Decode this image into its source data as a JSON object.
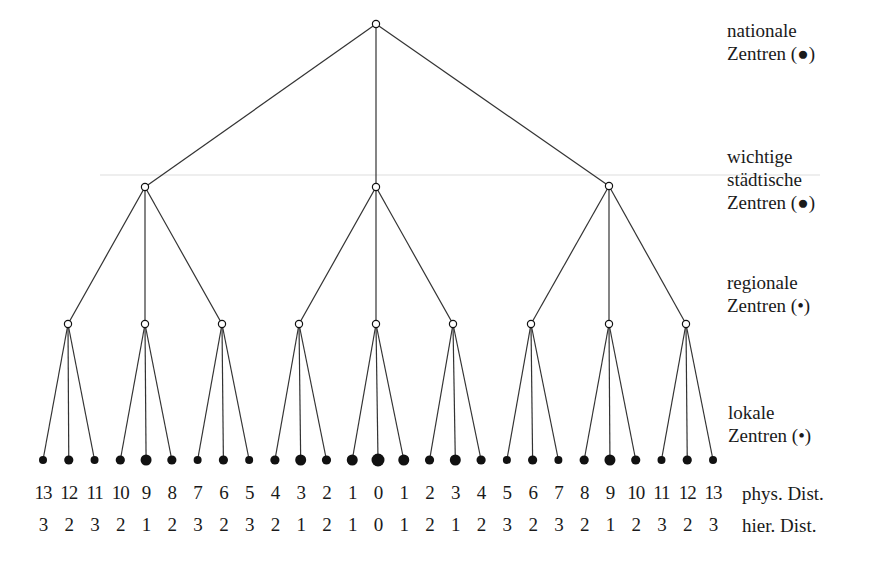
{
  "levels": [
    {
      "line1": "nationale",
      "line2": "Zentren (●)"
    },
    {
      "line1": "wichtige",
      "line2": "städtische",
      "line3": "Zentren (●)"
    },
    {
      "line1": "regionale",
      "line2": "Zentren (•)"
    },
    {
      "line1": "lokale",
      "line2": "Zentren (•)"
    }
  ],
  "rows": {
    "phys_label": "phys. Dist.",
    "hier_label": "hier. Dist.",
    "phys": [
      "13",
      "12",
      "11",
      "10",
      "9",
      "8",
      "7",
      "6",
      "5",
      "4",
      "3",
      "2",
      "1",
      "0",
      "1",
      "2",
      "3",
      "4",
      "5",
      "6",
      "7",
      "8",
      "9",
      "10",
      "11",
      "12",
      "13"
    ],
    "hier": [
      "3",
      "2",
      "3",
      "2",
      "1",
      "2",
      "3",
      "2",
      "3",
      "2",
      "1",
      "2",
      "1",
      "0",
      "1",
      "2",
      "2",
      "1",
      "2",
      "3",
      "2",
      "3",
      "2",
      "1",
      "2",
      "3",
      "2",
      "3"
    ]
  },
  "tree": {
    "root": {
      "x": 376,
      "y": 24
    },
    "cities": [
      {
        "x": 145,
        "y": 187
      },
      {
        "x": 376,
        "y": 187
      },
      {
        "x": 609,
        "y": 186
      }
    ],
    "regional_y": 324,
    "regional_x": [
      68,
      145,
      222,
      299,
      376,
      453,
      531,
      609,
      686
    ],
    "leaf_y": 460,
    "leaf_x0": 43,
    "leaf_dx": 25.77,
    "leaf_count": 27,
    "hier_for_leaf": [
      3,
      2,
      3,
      2,
      1,
      2,
      3,
      2,
      3,
      2,
      1,
      2,
      1,
      0,
      1,
      2,
      1,
      2,
      3,
      2,
      3,
      2,
      1,
      2,
      3,
      2,
      3
    ],
    "radius_by_hier": {
      "0": 6.5,
      "1": 5.5,
      "2": 4.6,
      "3": 4.0
    },
    "line_color": "#333333",
    "node_color": "#111111"
  }
}
